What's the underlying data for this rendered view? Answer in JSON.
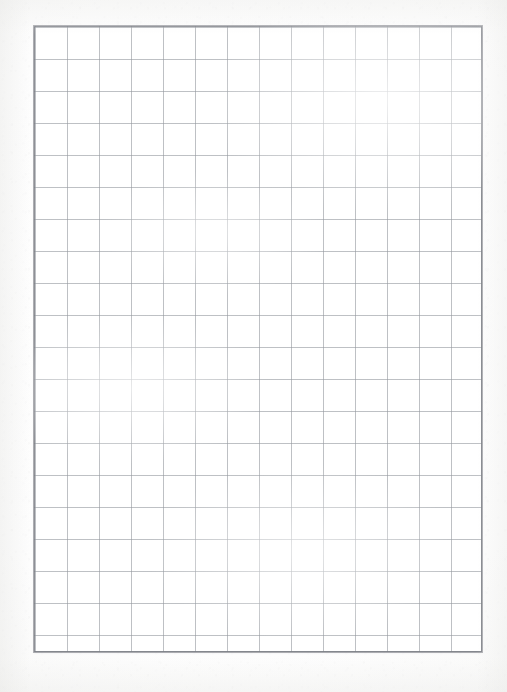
{
  "document": {
    "kind": "scanned-blank-graph-paper",
    "caption": "Blank quadrille ruled graph paper sheet",
    "visible_text": ""
  },
  "page": {
    "width_px": 507,
    "height_px": 692,
    "background_color": "#fdfdfd",
    "margin_color": "#ffffff"
  },
  "grid": {
    "label": "graph-paper-grid",
    "left_px": 34,
    "top_px": 26,
    "width_px": 448,
    "height_px": 626,
    "columns": 14,
    "rows": 19,
    "cell_width_px": 32,
    "cell_height_px": 32,
    "rule_color": "#969aa0",
    "border_color": "#7a7c84",
    "cell_fill_color": "#ffffff",
    "border_width_px": 1,
    "rule_width_px": 1,
    "has_major_rules": false,
    "has_labels": false,
    "has_margin_rule": false
  },
  "content": {
    "text_items": [],
    "annotations": [],
    "is_blank": "true"
  }
}
